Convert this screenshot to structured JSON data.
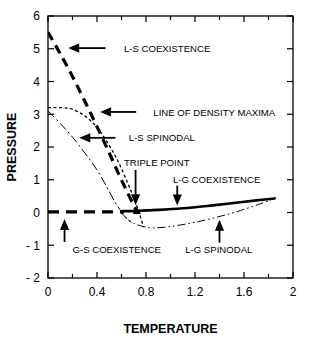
{
  "chart_data": {
    "type": "line",
    "title": "",
    "xlabel": "TEMPERATURE",
    "ylabel": "PRESSURE",
    "xlim": [
      0,
      2
    ],
    "ylim": [
      -2,
      6
    ],
    "grid": false,
    "legend_position": "inline-annotations",
    "xticks": [
      0,
      0.2,
      0.4,
      0.6,
      0.8,
      1.0,
      1.2,
      1.4,
      1.6,
      1.8,
      2.0
    ],
    "xtick_labels": [
      "0",
      "",
      "0.4",
      "",
      "0.8",
      "",
      "1.2",
      "",
      "1.6",
      "",
      "2"
    ],
    "yticks": [
      -2,
      -1,
      0,
      1,
      2,
      3,
      4,
      5,
      6
    ],
    "ytick_labels": [
      "- 2",
      "- 1",
      "0",
      "1",
      "2",
      "3",
      "4",
      "5",
      "6"
    ],
    "series": [
      {
        "name": "L-S COEXISTENCE",
        "style": "thick-dashed",
        "points": [
          [
            0.0,
            5.5
          ],
          [
            0.1,
            4.85
          ],
          [
            0.2,
            4.15
          ],
          [
            0.3,
            3.4
          ],
          [
            0.4,
            2.62
          ],
          [
            0.5,
            1.82
          ],
          [
            0.58,
            1.15
          ],
          [
            0.65,
            0.6
          ],
          [
            0.7,
            0.22
          ],
          [
            0.725,
            0.05
          ]
        ]
      },
      {
        "name": "LINE OF DENSITY MAXIMA",
        "style": "fine-dotted",
        "points": [
          [
            0.0,
            3.2
          ],
          [
            0.12,
            3.2
          ],
          [
            0.2,
            3.15
          ],
          [
            0.3,
            2.95
          ],
          [
            0.4,
            2.6
          ],
          [
            0.5,
            2.05
          ],
          [
            0.58,
            1.5
          ],
          [
            0.65,
            0.9
          ],
          [
            0.7,
            0.45
          ],
          [
            0.74,
            0.05
          ],
          [
            0.76,
            -0.2
          ],
          [
            0.78,
            -0.45
          ]
        ]
      },
      {
        "name": "L-S SPINODAL",
        "style": "dash-dot",
        "points": [
          [
            0.0,
            3.1
          ],
          [
            0.1,
            2.72
          ],
          [
            0.2,
            2.3
          ],
          [
            0.3,
            1.82
          ],
          [
            0.4,
            1.3
          ],
          [
            0.48,
            0.78
          ],
          [
            0.55,
            0.3
          ],
          [
            0.6,
            0.02
          ],
          [
            0.64,
            -0.18
          ],
          [
            0.68,
            -0.3
          ]
        ]
      },
      {
        "name": "L-G COEXISTENCE",
        "style": "thick-solid",
        "points": [
          [
            0.6,
            0.04
          ],
          [
            0.725,
            0.05
          ],
          [
            0.9,
            0.08
          ],
          [
            1.1,
            0.13
          ],
          [
            1.3,
            0.2
          ],
          [
            1.5,
            0.28
          ],
          [
            1.7,
            0.37
          ],
          [
            1.85,
            0.43
          ]
        ]
      },
      {
        "name": "L-G SPINODAL",
        "style": "dash-dot-dot",
        "points": [
          [
            0.6,
            -0.02
          ],
          [
            0.65,
            -0.2
          ],
          [
            0.7,
            -0.33
          ],
          [
            0.78,
            -0.43
          ],
          [
            0.85,
            -0.47
          ],
          [
            0.95,
            -0.45
          ],
          [
            1.05,
            -0.4
          ],
          [
            1.2,
            -0.3
          ],
          [
            1.35,
            -0.17
          ],
          [
            1.5,
            -0.02
          ],
          [
            1.62,
            0.12
          ],
          [
            1.72,
            0.25
          ],
          [
            1.82,
            0.38
          ]
        ]
      },
      {
        "name": "G-S COEXISTENCE",
        "style": "thick-dashed-horizontal",
        "points": [
          [
            0.0,
            0.02
          ],
          [
            0.62,
            0.02
          ]
        ]
      }
    ],
    "markers": [
      {
        "name": "TRIPLE POINT",
        "x": 0.725,
        "y": 0.05,
        "shape": "triangle"
      }
    ],
    "annotations": [
      {
        "text": "L-S COEXISTENCE",
        "arrow": "left",
        "label_x": 0.62,
        "label_y": 5.0
      },
      {
        "text": "LINE OF DENSITY MAXIMA",
        "arrow": "left",
        "label_x": 0.86,
        "label_y": 3.07
      },
      {
        "text": "L-S SPINODAL",
        "arrow": "left",
        "label_x": 0.66,
        "label_y": 2.28
      },
      {
        "text": "TRIPLE POINT",
        "arrow": "down",
        "label_x": 0.62,
        "label_y": 1.52
      },
      {
        "text": "L-G COEXISTENCE",
        "arrow": "down",
        "label_x": 1.02,
        "label_y": 1.02
      },
      {
        "text": "G-S COEXISTENCE",
        "arrow": "up",
        "label_x": 0.2,
        "label_y": -1.12
      },
      {
        "text": "L-G SPINODAL",
        "arrow": "up",
        "label_x": 1.12,
        "label_y": -1.12
      }
    ]
  },
  "axes": {
    "xlabel": "TEMPERATURE",
    "ylabel": "PRESSURE",
    "xtick_labels": [
      "0",
      "0.4",
      "0.8",
      "1.2",
      "1.6",
      "2"
    ],
    "ytick_labels": [
      "6",
      "5",
      "4",
      "3",
      "2",
      "1",
      "0",
      "- 1",
      "- 2"
    ]
  },
  "labels": {
    "ls_coexistence": "L-S COEXISTENCE",
    "density_maxima": "LINE OF DENSITY MAXIMA",
    "ls_spinodal": "L-S SPINODAL",
    "triple_point": "TRIPLE POINT",
    "lg_coexistence": "L-G COEXISTENCE",
    "gs_coexistence": "G-S COEXISTENCE",
    "lg_spinodal": "L-G SPINODAL"
  },
  "colors": {
    "line": "#000000",
    "background": "#ffffff",
    "text": "#000000"
  }
}
